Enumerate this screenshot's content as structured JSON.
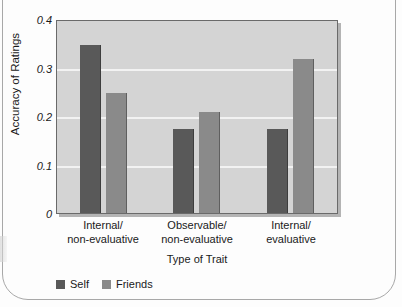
{
  "chart_data": {
    "type": "bar",
    "title": "",
    "xlabel": "Type of Trait",
    "ylabel": "Accuracy of Ratings",
    "categories": [
      "Internal/\nnon-evaluative",
      "Observable/\nnon-evaluative",
      "Internal/\nevaluative"
    ],
    "category_lines": [
      [
        "Internal/",
        "non-evaluative"
      ],
      [
        "Observable/",
        "non-evaluative"
      ],
      [
        "Internal/",
        "evaluative"
      ]
    ],
    "series": [
      {
        "name": "Self",
        "color": "#595959",
        "values": [
          0.35,
          0.175,
          0.175
        ]
      },
      {
        "name": "Friends",
        "color": "#8a8a8a",
        "values": [
          0.25,
          0.21,
          0.32
        ]
      }
    ],
    "ylim": [
      0,
      0.4
    ],
    "yticks": [
      0.4,
      0.3,
      0.2,
      0.1,
      0
    ],
    "ytick_labels": [
      "0.4",
      "0.3",
      "0.2",
      "0.1",
      "0"
    ],
    "grid": true,
    "legend_position": "bottom-left",
    "plot_background": "#d4d4d4",
    "gridline_color": "#f2f2f2"
  },
  "legend": {
    "items": [
      {
        "label": "Self",
        "color": "#595959"
      },
      {
        "label": "Friends",
        "color": "#8a8a8a"
      }
    ]
  }
}
